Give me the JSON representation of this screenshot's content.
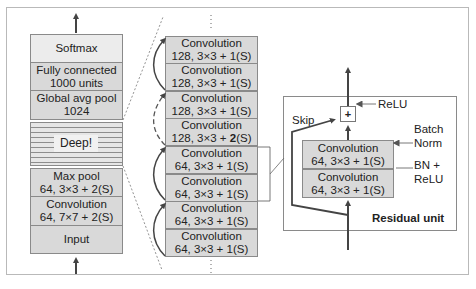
{
  "left_stack": {
    "layers": [
      {
        "name": "softmax",
        "line1": "Softmax",
        "line2": ""
      },
      {
        "name": "fully-connected",
        "line1": "Fully connected",
        "line2": "1000 units"
      },
      {
        "name": "global-avg-pool",
        "line1": "Global avg pool",
        "line2": "1024"
      },
      {
        "name": "deep",
        "line1": "Deep!",
        "line2": ""
      },
      {
        "name": "max-pool",
        "line1": "Max pool",
        "line2": "64, 3×3 + 2(S)"
      },
      {
        "name": "convolution",
        "line1": "Convolution",
        "line2": "64, 7×7 + 2(S)"
      },
      {
        "name": "input",
        "line1": "Input",
        "line2": ""
      }
    ]
  },
  "middle_stack": {
    "layers": [
      {
        "line1": "Convolution",
        "line2": "128, 3×3 + 1(S)"
      },
      {
        "line1": "Convolution",
        "line2": "128, 3×3 + 1(S)"
      },
      {
        "line1": "Convolution",
        "line2": "128, 3×3 + 1(S)"
      },
      {
        "line1": "Convolution",
        "line2_prefix": "128, 3×3 + ",
        "line2_bold": "2",
        "line2_suffix": "(S)"
      },
      {
        "line1": "Convolution",
        "line2": "64, 3×3 + 1(S)"
      },
      {
        "line1": "Convolution",
        "line2": "64, 3×3 + 1(S)"
      },
      {
        "line1": "Convolution",
        "line2": "64, 3×3 + 1(S)"
      },
      {
        "line1": "Convolution",
        "line2": "64, 3×3 + 1(S)"
      }
    ]
  },
  "residual_unit": {
    "title": "Residual unit",
    "plus_symbol": "+",
    "relu_label": "ReLU",
    "skip_label": "Skip",
    "batch_norm_label_1": "Batch",
    "batch_norm_label_2": "Norm",
    "bn_relu_label_1": "BN +",
    "bn_relu_label_2": "ReLU",
    "layers": [
      {
        "line1": "Convolution",
        "line2": "64, 3×3 + 1(S)"
      },
      {
        "line1": "Convolution",
        "line2": "64, 3×3 + 1(S)"
      }
    ]
  },
  "colors": {
    "box_fill": "#d9d9d9",
    "light_box_fill": "#ececec",
    "border": "#8a8a8a",
    "arrow": "#444444"
  }
}
